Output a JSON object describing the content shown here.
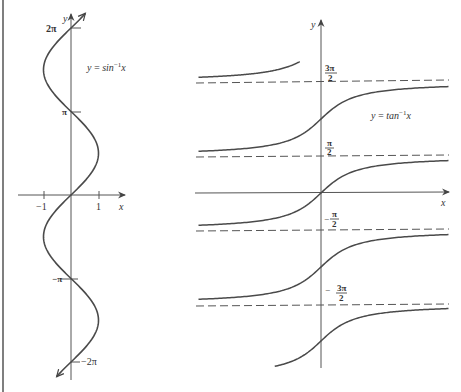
{
  "colors": {
    "curve": "#4a4a4a",
    "axis": "#555555",
    "dashed": "#555555",
    "text": "#333333",
    "border": "#555555"
  },
  "left_panel": {
    "curve_label": "y = sin⁻¹x",
    "curve_label_main": "y = sin",
    "curve_label_sup": "−1",
    "curve_label_var": "x",
    "y_axis_label": "y",
    "x_axis_label": "x",
    "y_ticks": [
      "2π",
      "π",
      "−π",
      "−2π"
    ],
    "x_ticks": [
      "−1",
      "1"
    ]
  },
  "right_panel": {
    "curve_label_main": "y = tan",
    "curve_label_sup": "−1",
    "curve_label_var": "x",
    "y_axis_label": "y",
    "x_axis_label": "x",
    "asymptote_labels": [
      {
        "sign": "",
        "num": "3π",
        "den": "2"
      },
      {
        "sign": "",
        "num": "π",
        "den": "2"
      },
      {
        "sign": "−",
        "num": "π",
        "den": "2"
      },
      {
        "sign": "−",
        "num": "3π",
        "den": "2"
      }
    ]
  },
  "chart_data": [
    {
      "type": "line",
      "title": "y = sin⁻¹x (multivalued relation x = sin y)",
      "xlabel": "x",
      "ylabel": "y",
      "x_ticks": [
        "-1",
        "1"
      ],
      "y_ticks": [
        "-2π",
        "-π",
        "π",
        "2π"
      ],
      "xlim": [
        -1.3,
        1.9
      ],
      "ylim": [
        -6.6,
        6.6
      ],
      "series": [
        {
          "name": "x = sin y",
          "relation": "x = sin(y)",
          "y_range": [
            -6.6,
            6.6
          ],
          "arrows_at_ends": true
        }
      ],
      "grid": false
    },
    {
      "type": "line",
      "title": "y = tan⁻¹x (multivalued branches)",
      "xlabel": "x",
      "ylabel": "y",
      "asymptotes_y": [
        "-3π/2",
        "-π/2",
        "π/2",
        "3π/2"
      ],
      "series": [
        {
          "name": "branch k=-1",
          "relation": "y = arctan(x) - π"
        },
        {
          "name": "branch k=0",
          "relation": "y = arctan(x)"
        },
        {
          "name": "branch k=1",
          "relation": "y = arctan(x) + π"
        },
        {
          "name": "branch k=2 (partial, x<0)",
          "relation": "y = arctan(x) + 2π"
        },
        {
          "name": "branch k=-2 (partial, x>0)",
          "relation": "y = arctan(x) - 2π"
        }
      ],
      "grid": false
    }
  ]
}
